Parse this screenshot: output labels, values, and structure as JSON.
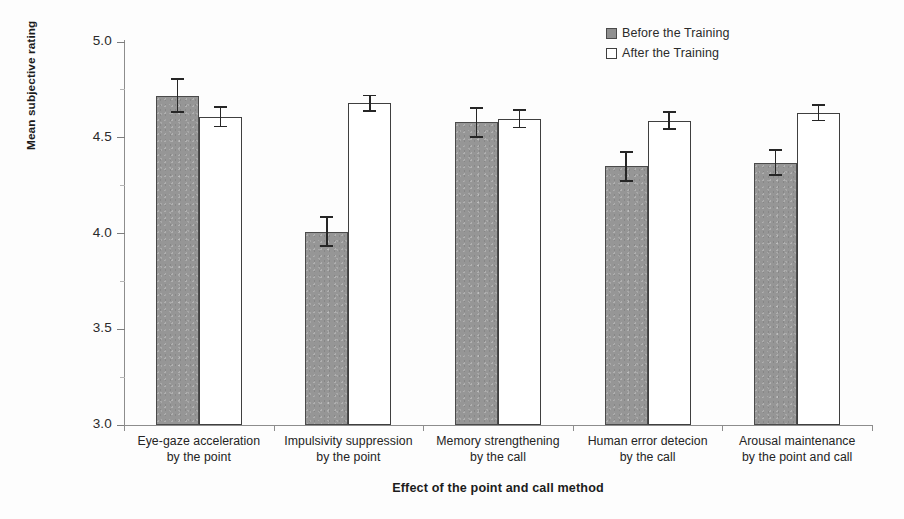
{
  "chart_data": {
    "type": "bar",
    "title": "",
    "xlabel": "Effect of the point and call method",
    "ylabel": "Mean subjective rating",
    "ylim": [
      3.0,
      5.0
    ],
    "ytick_labels": [
      "5.0",
      "4.5",
      "4.0",
      "3.5",
      "3.0"
    ],
    "ytick_values": [
      5.0,
      4.5,
      4.0,
      3.5,
      3.0
    ],
    "grid": false,
    "legend_position": "top-right",
    "categories": [
      "Eye-gaze acceleration by the point",
      "Impulsivity suppression by the point",
      "Memory strengthening by the call",
      "Human error detecion by the call",
      "Arousal maintenance by the point and call"
    ],
    "category_lines": [
      {
        "line1": "Eye-gaze acceleration",
        "line2": "by the point"
      },
      {
        "line1": "Impulsivity suppression",
        "line2": "by the point"
      },
      {
        "line1": "Memory strengthening",
        "line2": "by the call"
      },
      {
        "line1": "Human error detecion",
        "line2": "by the call"
      },
      {
        "line1": "Arousal maintenance",
        "line2": "by the point and call"
      }
    ],
    "series": [
      {
        "name": "Before the Training",
        "color": "#969696",
        "values": [
          4.72,
          4.01,
          4.58,
          4.35,
          4.37
        ],
        "errors": [
          0.09,
          0.08,
          0.08,
          0.08,
          0.07
        ]
      },
      {
        "name": "After the Training",
        "color": "#ffffff",
        "values": [
          4.61,
          4.68,
          4.6,
          4.59,
          4.63
        ],
        "errors": [
          0.055,
          0.045,
          0.05,
          0.05,
          0.045
        ]
      }
    ]
  },
  "legend": {
    "items": [
      {
        "label": "Before the Training",
        "swatch": "before"
      },
      {
        "label": "After the Training",
        "swatch": "after"
      }
    ]
  },
  "axes": {
    "x_title": "Effect of the point and call method",
    "y_title": "Mean subjective rating"
  }
}
